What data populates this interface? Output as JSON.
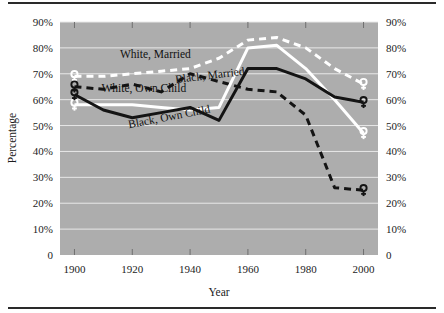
{
  "figure": {
    "background": "#ffffff",
    "plot_background": "#adadad",
    "gridline_color": "#e8e8e8",
    "rule_color": "#2a2a2a",
    "marker_glyph": "♀",
    "marker_name": "female-symbol-marker"
  },
  "chart_data": {
    "type": "line",
    "title": "",
    "xlabel": "Year",
    "ylabel": "Percentage",
    "x": [
      1900,
      1910,
      1920,
      1930,
      1940,
      1950,
      1960,
      1970,
      1980,
      1990,
      2000
    ],
    "xlim": [
      1895,
      2005
    ],
    "ylim": [
      0,
      90
    ],
    "xticks": [
      1900,
      1920,
      1940,
      1960,
      1980,
      2000
    ],
    "xtick_labels": [
      "1900",
      "1920",
      "1940",
      "1960",
      "1980",
      "2000"
    ],
    "yticks": [
      0,
      10,
      20,
      30,
      40,
      50,
      60,
      70,
      80,
      90
    ],
    "ytick_labels": [
      "0",
      "10%",
      "20%",
      "30%",
      "40%",
      "50%",
      "60%",
      "70%",
      "80%",
      "90%"
    ],
    "ytick_labels_right": [
      "0",
      "10%",
      "20%",
      "30%",
      "40%",
      "50%",
      "60%",
      "70%",
      "80%",
      "90%"
    ],
    "grid": true,
    "grid_axis": "y",
    "legend_position": "inline-annotations",
    "series": [
      {
        "name": "White, Married",
        "label": "White, Married",
        "color": "#ffffff",
        "style": "dashed",
        "width": 3,
        "values": [
          69,
          69,
          70,
          71,
          72,
          76,
          83,
          84,
          80,
          72,
          66
        ],
        "label_x": 1928,
        "label_y": 76,
        "label_rotate": 0,
        "markers": [
          1900,
          2000
        ]
      },
      {
        "name": "Black, Married",
        "label": "Black, Married",
        "color": "#141414",
        "style": "dashed",
        "width": 3,
        "values": [
          65,
          64,
          66,
          63,
          70,
          67,
          64,
          63,
          54,
          26,
          25
        ],
        "label_x": 1947,
        "label_y": 68,
        "label_rotate": -7,
        "markers": [
          1900,
          2000
        ]
      },
      {
        "name": "White, Own Child",
        "label": "White, Own Child",
        "color": "#ffffff",
        "style": "solid",
        "width": 3,
        "values": [
          58,
          58,
          58,
          57,
          56,
          57,
          80,
          81,
          72,
          60,
          47
        ],
        "label_x": 1924,
        "label_y": 63,
        "label_rotate": 0,
        "markers": [
          1900,
          2000
        ]
      },
      {
        "name": "Black, Own Child",
        "label": "Black, Own Child",
        "color": "#141414",
        "style": "solid",
        "width": 3,
        "values": [
          62,
          56,
          53,
          55,
          57,
          52,
          72,
          72,
          68,
          61,
          59
        ],
        "label_x": 1933,
        "label_y": 52,
        "label_rotate": -11,
        "markers": [
          1900,
          2000
        ]
      }
    ]
  }
}
